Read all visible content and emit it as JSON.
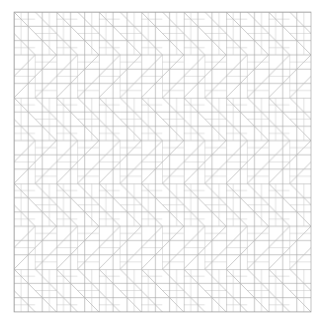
{
  "figure": {
    "type": "geometric-pattern",
    "region": {
      "x": 14,
      "y": 12,
      "width": 297,
      "height": 300
    },
    "tile": {
      "width": 42.43,
      "height": 85.7
    },
    "fine_grid_step": 7.07,
    "colors": {
      "background": "#ffffff",
      "grid_line": "#9a9a9a",
      "grid_line_light": "#c8c8c8",
      "diagonal": "#b0b0b0"
    }
  }
}
